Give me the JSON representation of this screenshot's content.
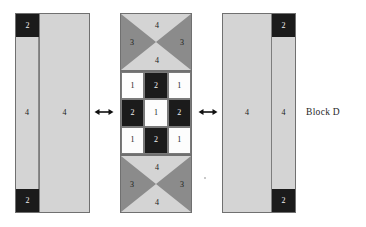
{
  "figure": {
    "caption": "Block D",
    "background_color": "#ffffff"
  },
  "palette": {
    "fabric_light_gray": "#d4d4d4",
    "fabric_white": "#fdfdfd",
    "fabric_black": "#1b1b1b",
    "fabric_medium_gray": "#8b8b8b",
    "outline": "#707070",
    "label_dark": "#1a1a1a",
    "label_light": "#f2f2f2"
  },
  "left_block": {
    "name": "left-sashing-block",
    "narrow_strip": {
      "top_square_label": "2",
      "middle_label": "4",
      "bottom_square_label": "2"
    },
    "wide_strip": {
      "label": "4"
    }
  },
  "arrow_left": {
    "icon": "double-headed-horizontal-arrow-icon"
  },
  "center_block": {
    "name": "center-pieced-block",
    "top_hourglass": {
      "top_label": "4",
      "left_label": "3",
      "right_label": "3",
      "bottom_label": "4"
    },
    "nine_patch": {
      "rows": [
        [
          {
            "label": "1",
            "fabric": "white"
          },
          {
            "label": "2",
            "fabric": "black"
          },
          {
            "label": "1",
            "fabric": "white"
          }
        ],
        [
          {
            "label": "2",
            "fabric": "black"
          },
          {
            "label": "1",
            "fabric": "white"
          },
          {
            "label": "2",
            "fabric": "black"
          }
        ],
        [
          {
            "label": "1",
            "fabric": "white"
          },
          {
            "label": "2",
            "fabric": "black"
          },
          {
            "label": "1",
            "fabric": "white"
          }
        ]
      ]
    },
    "bottom_hourglass": {
      "top_label": "4",
      "left_label": "3",
      "right_label": "3",
      "bottom_label": "4"
    }
  },
  "arrow_right": {
    "icon": "double-headed-horizontal-arrow-icon"
  },
  "right_block": {
    "name": "right-sashing-block",
    "wide_strip": {
      "label": "4"
    },
    "narrow_strip": {
      "top_square_label": "2",
      "middle_label": "4",
      "bottom_square_label": "2"
    }
  }
}
